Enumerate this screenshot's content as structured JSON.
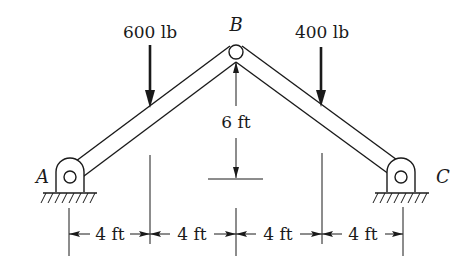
{
  "diagram": {
    "type": "two-member frame / truss with pinned supports",
    "points": {
      "A": "A",
      "B": "B",
      "C": "C"
    },
    "loads": [
      {
        "label": "600 lb",
        "direction": "down",
        "position": "left member"
      },
      {
        "label": "400 lb",
        "direction": "down",
        "position": "right member"
      }
    ],
    "dimensions": {
      "height": "6 ft",
      "spans": [
        "4 ft",
        "4 ft",
        "4 ft",
        "4 ft"
      ]
    },
    "colors": {
      "line": "#1a1a1a",
      "background": "#ffffff"
    }
  }
}
